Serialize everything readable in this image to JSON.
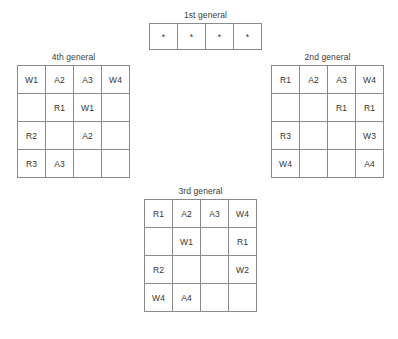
{
  "grids": [
    {
      "id": "first",
      "title": "1st general",
      "rows": [
        [
          "*",
          "*",
          "*",
          "*"
        ]
      ]
    },
    {
      "id": "fourth",
      "title": "4th general",
      "rows": [
        [
          "W1",
          "A2",
          "A3",
          "W4"
        ],
        [
          "",
          "R1",
          "W1",
          ""
        ],
        [
          "R2",
          "",
          "A2",
          ""
        ],
        [
          "R3",
          "A3",
          "",
          ""
        ]
      ]
    },
    {
      "id": "second",
      "title": "2nd general",
      "rows": [
        [
          "R1",
          "A2",
          "A3",
          "W4"
        ],
        [
          "",
          "",
          "R1",
          "R1"
        ],
        [
          "R3",
          "",
          "",
          "W3"
        ],
        [
          "W4",
          "",
          "",
          "A4"
        ]
      ]
    },
    {
      "id": "third",
      "title": "3rd general",
      "rows": [
        [
          "R1",
          "A2",
          "A3",
          "W4"
        ],
        [
          "",
          "W1",
          "",
          "R1"
        ],
        [
          "R2",
          "",
          "",
          "W2"
        ],
        [
          "W4",
          "A4",
          "",
          ""
        ]
      ]
    }
  ],
  "colors": {
    "background": "#ffffff",
    "border": "#8a8a8a",
    "text": "#333333",
    "title_text": "#3c3c3c"
  }
}
